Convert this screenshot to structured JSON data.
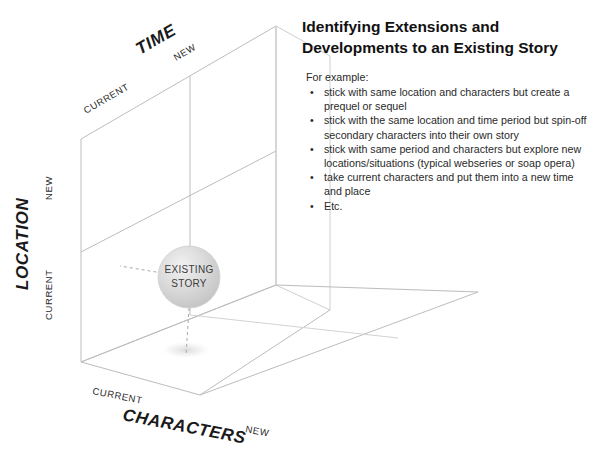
{
  "slide": {
    "background_color": "#ffffff",
    "line_color": "#b9b9b9",
    "text_color": "#2a2a2a"
  },
  "panel": {
    "title": "Identifying Extensions and Developments to an Existing Story",
    "intro": "For example:",
    "bullets": [
      "stick with same location and characters but create a prequel or sequel",
      "stick with the same location and time period but spin-off secondary characters into their own story",
      "stick with same period and characters but explore new locations/situations (typical webseries or soap opera)",
      "take current characters and put them into a new time and place",
      "Etc."
    ],
    "bullet_marker": "•"
  },
  "diagram": {
    "type": "3d-axes-cube",
    "node": {
      "label_line1": "EXISTING",
      "label_line2": "STORY",
      "fill": "#d9d9d9"
    },
    "axes": [
      {
        "name": "time",
        "title": "TIME",
        "ticks": [
          "CURRENT",
          "NEW"
        ],
        "orientation": "diagonal-up-right"
      },
      {
        "name": "location",
        "title": "LOCATION",
        "ticks": [
          "NEW",
          "CURRENT"
        ],
        "orientation": "vertical"
      },
      {
        "name": "characters",
        "title": "CHARACTERS",
        "ticks": [
          "CURRENT",
          "NEW"
        ],
        "orientation": "diagonal-down-right"
      }
    ]
  }
}
